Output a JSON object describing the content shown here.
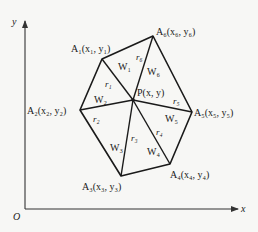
{
  "diagram": {
    "type": "inverse-distance-weighting / Thiessen-like triangulation around point P",
    "axes": {
      "origin_label": "O",
      "x_label": "x",
      "y_label": "y"
    },
    "center_point": {
      "name": "P",
      "label": "P(x, y)"
    },
    "vertices": [
      {
        "id": "A1",
        "label": "A₁(x₁, y₁)"
      },
      {
        "id": "A2",
        "label": "A₂(x₂, y₂)"
      },
      {
        "id": "A3",
        "label": "A₃(x₃, y₃)"
      },
      {
        "id": "A4",
        "label": "A₄(x₄, y₄)"
      },
      {
        "id": "A5",
        "label": "A₅(x₅, y₅)"
      },
      {
        "id": "A6",
        "label": "A₆(x₆, y₆)"
      }
    ],
    "distances": [
      "r₁",
      "r₂",
      "r₃",
      "r₄",
      "r₅",
      "r₆"
    ],
    "weights": [
      "W₁",
      "W₂",
      "W₃",
      "W₄",
      "W₅",
      "W₆"
    ],
    "colors": {
      "line": "#1a1a1a",
      "background": "#f7f7f5"
    }
  }
}
